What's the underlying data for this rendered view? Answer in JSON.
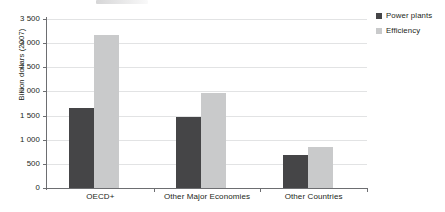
{
  "chart_data": {
    "type": "bar",
    "title": "",
    "subtitle": "",
    "xlabel": "",
    "ylabel": "Billion dollars (2007)",
    "categories": [
      "OECD+",
      "Other Major Economies",
      "Other Countries"
    ],
    "series": [
      {
        "name": "Power plants",
        "color": "#454547",
        "values": [
          1650,
          1480,
          690
        ]
      },
      {
        "name": "Efficiency",
        "color": "#c9cacb",
        "values": [
          3160,
          1960,
          840
        ]
      }
    ],
    "ylim": [
      0,
      3500
    ],
    "ytick_values": [
      0,
      500,
      1000,
      1500,
      2000,
      2500,
      3000,
      3500
    ],
    "ytick_labels": [
      "0",
      "500",
      "1 000",
      "1 500",
      "2 000",
      "2 500",
      "3 000",
      "3 500"
    ],
    "grid": true,
    "grid_axis": "y",
    "legend_position": "right-top",
    "bar_orientation": "vertical"
  },
  "legend": {
    "items": [
      {
        "label": "Power plants",
        "color": "#454547"
      },
      {
        "label": "Efficiency",
        "color": "#c9cacb"
      }
    ]
  },
  "axes": {
    "y_title": "Billion dollars (2007)"
  }
}
